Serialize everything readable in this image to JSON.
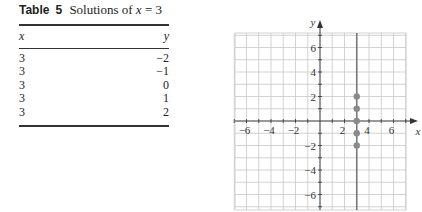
{
  "table": {
    "label": "Table",
    "number": "5",
    "caption_prefix": "Solutions of",
    "caption_var": "x",
    "caption_eq": "= 3",
    "columns": [
      "x",
      "y"
    ],
    "rows": [
      [
        "3",
        "−2"
      ],
      [
        "3",
        "−1"
      ],
      [
        "3",
        "0"
      ],
      [
        "3",
        "1"
      ],
      [
        "3",
        "2"
      ]
    ]
  },
  "chart_data": {
    "type": "scatter",
    "title": "",
    "xlabel": "x",
    "ylabel": "y",
    "xlim": [
      -7,
      7
    ],
    "ylim": [
      -7,
      7
    ],
    "grid": true,
    "x_tick_labels": [
      "−6",
      "−4",
      "−2",
      "2",
      "4",
      "6"
    ],
    "y_tick_labels": [
      "6",
      "4",
      "2",
      "−2",
      "−4",
      "−6"
    ],
    "x_ticks": [
      -6,
      -4,
      -2,
      2,
      4,
      6
    ],
    "y_ticks": [
      6,
      4,
      2,
      -2,
      -4,
      -6
    ],
    "points": [
      {
        "x": 3,
        "y": -2
      },
      {
        "x": 3,
        "y": -1
      },
      {
        "x": 3,
        "y": 0
      },
      {
        "x": 3,
        "y": 1
      },
      {
        "x": 3,
        "y": 2
      }
    ],
    "vertical_line": {
      "x": 3,
      "label": "x = 3"
    },
    "colors": {
      "grid": "#c8c8c8",
      "axis": "#333333",
      "line": "#7a7a7a",
      "point": "#8a8a8a"
    }
  }
}
